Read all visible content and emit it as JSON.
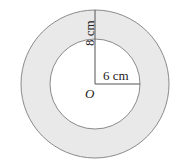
{
  "diagram": {
    "type": "annulus",
    "outer_radius_label": "8 cm",
    "inner_radius_label": "6 cm",
    "center_label": "O",
    "colors": {
      "ring_fill": "#e9e9e9",
      "inner_fill": "#ffffff",
      "stroke": "#8a8a8a",
      "line": "#555555"
    }
  }
}
